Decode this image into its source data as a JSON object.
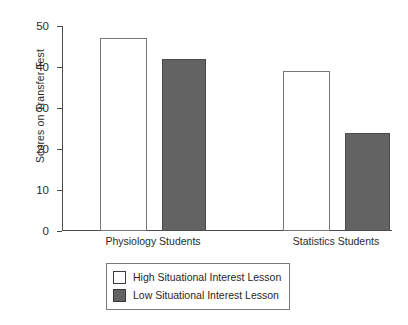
{
  "chart_data": {
    "type": "bar",
    "title": "",
    "xlabel": "",
    "ylabel": "Scores on Transfer Test",
    "ylim": [
      0,
      50
    ],
    "ytick_labels": [
      "0",
      "10",
      "20",
      "30",
      "40",
      "50"
    ],
    "ytick_values": [
      0,
      10,
      20,
      30,
      40,
      50
    ],
    "grid": false,
    "legend_position": "bottom-center",
    "categories": [
      "Physiology Students",
      "Statistics Students"
    ],
    "series": [
      {
        "name": "High Situational Interest Lesson",
        "color": "#ffffff",
        "values": [
          47,
          39
        ]
      },
      {
        "name": "Low Situational Interest Lesson",
        "color": "#636363",
        "values": [
          42,
          24
        ]
      }
    ]
  },
  "axis": {
    "y_title": "Scores on Transfer Test",
    "ticks": [
      {
        "label": "50",
        "value": 50
      },
      {
        "label": "40",
        "value": 40
      },
      {
        "label": "30",
        "value": 30
      },
      {
        "label": "20",
        "value": 20
      },
      {
        "label": "10",
        "value": 10
      },
      {
        "label": "0",
        "value": 0
      }
    ]
  },
  "categories": [
    {
      "label": "Physiology Students"
    },
    {
      "label": "Statistics Students"
    }
  ],
  "bars": [
    {
      "name": "physiology-high",
      "value": 47,
      "style": "light"
    },
    {
      "name": "physiology-low",
      "value": 42,
      "style": "dark"
    },
    {
      "name": "statistics-high",
      "value": 39,
      "style": "light"
    },
    {
      "name": "statistics-low",
      "value": 24,
      "style": "dark"
    }
  ],
  "legend": {
    "items": [
      {
        "label": "High Situational Interest Lesson",
        "style": "light"
      },
      {
        "label": "Low Situational Interest Lesson",
        "style": "dark"
      }
    ]
  }
}
